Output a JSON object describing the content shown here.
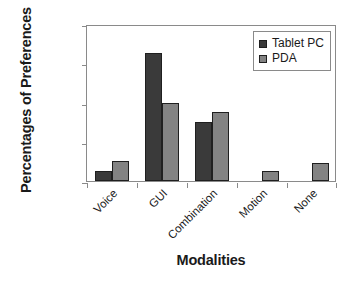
{
  "chart_data": {
    "type": "bar",
    "title": "",
    "subtitle": "",
    "xlabel": "Modalities",
    "ylabel": "Percentages of Preferences",
    "categories": [
      "Voice",
      "GUI",
      "Combination",
      "Motion",
      "None"
    ],
    "series": [
      {
        "name": "Tablet PC",
        "color": "#3a3a3a",
        "values": [
          5,
          65,
          30,
          0,
          0
        ]
      },
      {
        "name": "PDA",
        "color": "#838383",
        "values": [
          10,
          40,
          35,
          5,
          9
        ]
      }
    ],
    "ylim": [
      0,
      80
    ],
    "ytick_values": [
      0,
      20,
      40,
      60,
      80
    ],
    "ytick_labels": [
      "0%",
      "20%",
      "40%",
      "60%",
      "80%"
    ],
    "grid": false,
    "legend_position": "top-right",
    "xtick_rotation": -45,
    "frame_color": "#8a8a8a",
    "bar_edge_color": "#1f1f1f",
    "background": "#ffffff"
  }
}
